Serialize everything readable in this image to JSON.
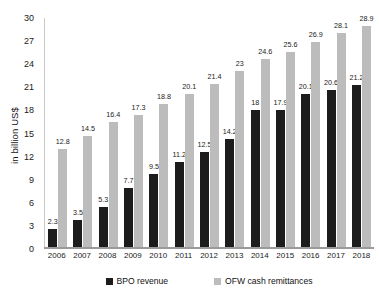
{
  "chart_data": {
    "type": "bar",
    "title": "",
    "subtitle": "",
    "xlabel": "",
    "ylabel": "in billion US$",
    "ylim": [
      0,
      30
    ],
    "yticks": [
      0,
      3,
      6,
      9,
      12,
      15,
      18,
      21,
      24,
      27,
      30
    ],
    "grid": false,
    "legend_position": "bottom",
    "categories": [
      "2006",
      "2007",
      "2008",
      "2009",
      "2010",
      "2011",
      "2012",
      "2013",
      "2014",
      "2015",
      "2016",
      "2017",
      "2018"
    ],
    "series": [
      {
        "name": "BPO revenue",
        "color": "#1c1c1c",
        "values": [
          2.3,
          3.5,
          5.3,
          7.7,
          9.5,
          11.2,
          12.5,
          14.2,
          18,
          17.9,
          20.1,
          20.6,
          21.2
        ],
        "labels": [
          "2.3",
          "3.5",
          "5.3",
          "7.7",
          "9.5",
          "11.2",
          "12.5",
          "14.2",
          "18",
          "17.9",
          "20.1",
          "20.6",
          "21.2"
        ]
      },
      {
        "name": "OFW cash remittances",
        "color": "#bcbcbc",
        "values": [
          12.8,
          14.5,
          16.4,
          17.3,
          18.8,
          20.1,
          21.4,
          23,
          24.6,
          25.6,
          26.9,
          28.1,
          28.9
        ],
        "labels": [
          "12.8",
          "14.5",
          "16.4",
          "17.3",
          "18.8",
          "20.1",
          "21.4",
          "23",
          "24.6",
          "25.6",
          "26.9",
          "28.1",
          "28.9"
        ]
      }
    ]
  }
}
